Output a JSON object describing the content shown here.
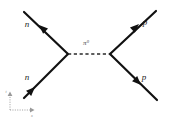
{
  "diagram": {
    "background_color": "#ffffff",
    "line_color": "#111111",
    "propagator_color": "#2a2a2a",
    "axis_color": "#9a9a9a",
    "vertices": {
      "left": {
        "x": 68,
        "y": 54
      },
      "right": {
        "x": 110,
        "y": 54
      }
    },
    "propagator": {
      "name": "pion-propagator",
      "symbol": "π",
      "superscript": "0",
      "style": "dashed",
      "label_x": 86,
      "label_y": 45
    },
    "legs": [
      {
        "id": "leg-upper-left",
        "label": "n",
        "particle": "neutron",
        "direction": "outgoing",
        "x1": 68,
        "y1": 54,
        "x2": 24,
        "y2": 12,
        "label_x": 27,
        "label_y": 27,
        "arrow_x": 39,
        "arrow_y": 25,
        "arrow_angle": 223
      },
      {
        "id": "leg-lower-left",
        "label": "n",
        "particle": "neutron",
        "direction": "incoming",
        "x1": 24,
        "y1": 98,
        "x2": 68,
        "y2": 54,
        "label_x": 27,
        "label_y": 80,
        "arrow_x": 35,
        "arrow_y": 87,
        "arrow_angle": 315
      },
      {
        "id": "leg-upper-right",
        "label": "p",
        "particle": "proton",
        "direction": "outgoing",
        "x1": 110,
        "y1": 54,
        "x2": 156,
        "y2": 11,
        "label_x": 145,
        "label_y": 25,
        "arrow_x": 139,
        "arrow_y": 24,
        "arrow_angle": 317
      },
      {
        "id": "leg-lower-right",
        "label": "p",
        "particle": "proton",
        "direction": "outgoing",
        "x1": 110,
        "y1": 54,
        "x2": 157,
        "y2": 100,
        "label_x": 144,
        "label_y": 80,
        "arrow_x": 141,
        "arrow_y": 85,
        "arrow_angle": 45
      }
    ],
    "axes": {
      "name": "coordinate-axes",
      "origin": {
        "x": 10,
        "y": 110
      },
      "vertical": {
        "x2": 10,
        "y2": 93,
        "label": "t",
        "label_x": 6,
        "label_y": 93
      },
      "horizontal": {
        "x2": 33,
        "y2": 110,
        "label": "x",
        "label_x": 32,
        "label_y": 116
      }
    }
  }
}
